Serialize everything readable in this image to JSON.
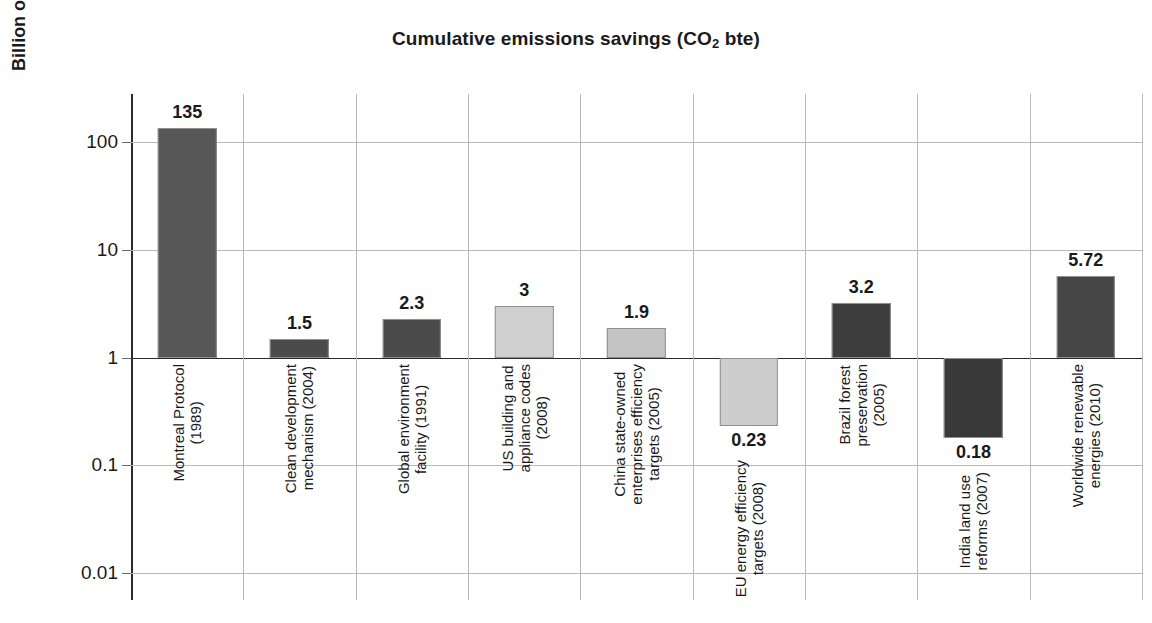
{
  "chart_data": {
    "type": "bar",
    "title": "Cumulative emissions savings (CO2 bte)",
    "title_main": "Cumulative emissions savings (CO",
    "title_sub": "2",
    "title_tail": " bte)",
    "xlabel": "",
    "ylabel": "Billion of tonnes CO2 equivalent (log scale)",
    "ylabel_main": "Billion of tonnes CO",
    "ylabel_sub": "2",
    "ylabel_tail": " equivalent (log scale)",
    "scale": "log",
    "grid": true,
    "legend": "none",
    "baseline": 1,
    "ylim": [
      0.0056,
      280
    ],
    "ytick_labels": [
      "100",
      "10",
      "1",
      "0.1",
      "0.01"
    ],
    "ytick_values": [
      100,
      10,
      1,
      0.1,
      0.01
    ],
    "categories": [
      "Montreal Protocol (1989)",
      "Clean development mechanism (2004)",
      "Global environment facility (1991)",
      "US building and appliance codes (2008)",
      "China state-owned enterprises efficiency targets (2005)",
      "EU energy efficiency targets (2008)",
      "Brazil forest preservation (2005)",
      "India land use reforms (2007)",
      "Worldwide renewable energies (2010)"
    ],
    "values": [
      135,
      1.5,
      2.3,
      3,
      1.9,
      0.23,
      3.2,
      0.18,
      5.72
    ],
    "value_labels": [
      "135",
      "1.5",
      "2.3",
      "3",
      "1.9",
      "0.23",
      "3.2",
      "0.18",
      "5.72"
    ],
    "bars": [
      {
        "label": "Montreal Protocol (1989)",
        "label_lines": [
          "Montreal Protocol",
          "(1989)"
        ],
        "value": 135,
        "value_label": "135",
        "color": "#575757",
        "direction": "up"
      },
      {
        "label": "Clean development mechanism (2004)",
        "label_lines": [
          "Clean development",
          "mechanism (2004)"
        ],
        "value": 1.5,
        "value_label": "1.5",
        "color": "#4b4b4b",
        "direction": "up"
      },
      {
        "label": "Global environment facility (1991)",
        "label_lines": [
          "Global environment",
          "facility (1991)"
        ],
        "value": 2.3,
        "value_label": "2.3",
        "color": "#4b4b4b",
        "direction": "up"
      },
      {
        "label": "US building and appliance codes (2008)",
        "label_lines": [
          "US building and",
          "appliance codes",
          "(2008)"
        ],
        "value": 3,
        "value_label": "3",
        "color": "#cfcfcf",
        "direction": "up"
      },
      {
        "label": "China state-owned enterprises efficiency targets (2005)",
        "label_lines": [
          "China state-owned",
          "enterprises efficiency",
          "targets (2005)"
        ],
        "value": 1.9,
        "value_label": "1.9",
        "color": "#c4c4c4",
        "direction": "up"
      },
      {
        "label": "EU energy efficiency targets (2008)",
        "label_lines": [
          "EU energy efficiency",
          "targets (2008)"
        ],
        "value": 0.23,
        "value_label": "0.23",
        "color": "#cdcdcd",
        "direction": "down"
      },
      {
        "label": "Brazil forest preservation (2005)",
        "label_lines": [
          "Brazil forest",
          "preservation",
          "(2005)"
        ],
        "value": 3.2,
        "value_label": "3.2",
        "color": "#3d3d3d",
        "direction": "up"
      },
      {
        "label": "India land use reforms (2007)",
        "label_lines": [
          "India land use",
          "reforms (2007)"
        ],
        "value": 0.18,
        "value_label": "0.18",
        "color": "#393939",
        "direction": "down"
      },
      {
        "label": "Worldwide renewable energies (2010)",
        "label_lines": [
          "Worldwide renewable",
          "energies (2010)"
        ],
        "value": 5.72,
        "value_label": "5.72",
        "color": "#464646",
        "direction": "up"
      }
    ],
    "colors": {
      "axis": "#2b2b2b",
      "grid": "#b9b9b9",
      "text": "#1a1a1a",
      "background": "#ffffff"
    }
  }
}
